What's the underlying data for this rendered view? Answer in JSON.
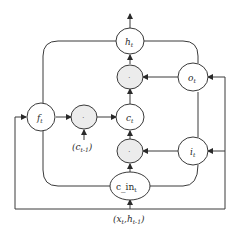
{
  "diagram": {
    "type": "lstm-cell",
    "nodes": {
      "h_t": {
        "base": "h",
        "sub": "t"
      },
      "o_t": {
        "base": "o",
        "sub": "t"
      },
      "c_t": {
        "base": "c",
        "sub": "t"
      },
      "f_t": {
        "base": "f",
        "sub": "t"
      },
      "i_t": {
        "base": "i",
        "sub": "t"
      },
      "c_in_t": {
        "base": "c_in",
        "sub": "t"
      },
      "mult_output": {
        "symbol": "·"
      },
      "mult_forget": {
        "symbol": "·"
      },
      "mult_input": {
        "symbol": "·"
      }
    },
    "inputs": {
      "c_prev": {
        "open": "(",
        "base": "c",
        "sub": "t-1",
        "close": ")"
      },
      "x_h": {
        "open": "(",
        "x": "x",
        "x_sub": "t",
        "sep": ",",
        "h": "h",
        "h_sub": "t-1",
        "close": ")"
      }
    },
    "colors": {
      "stroke": "#3a3a3a",
      "gate_fill": "#ececec",
      "node_fill": "#ffffff"
    }
  }
}
